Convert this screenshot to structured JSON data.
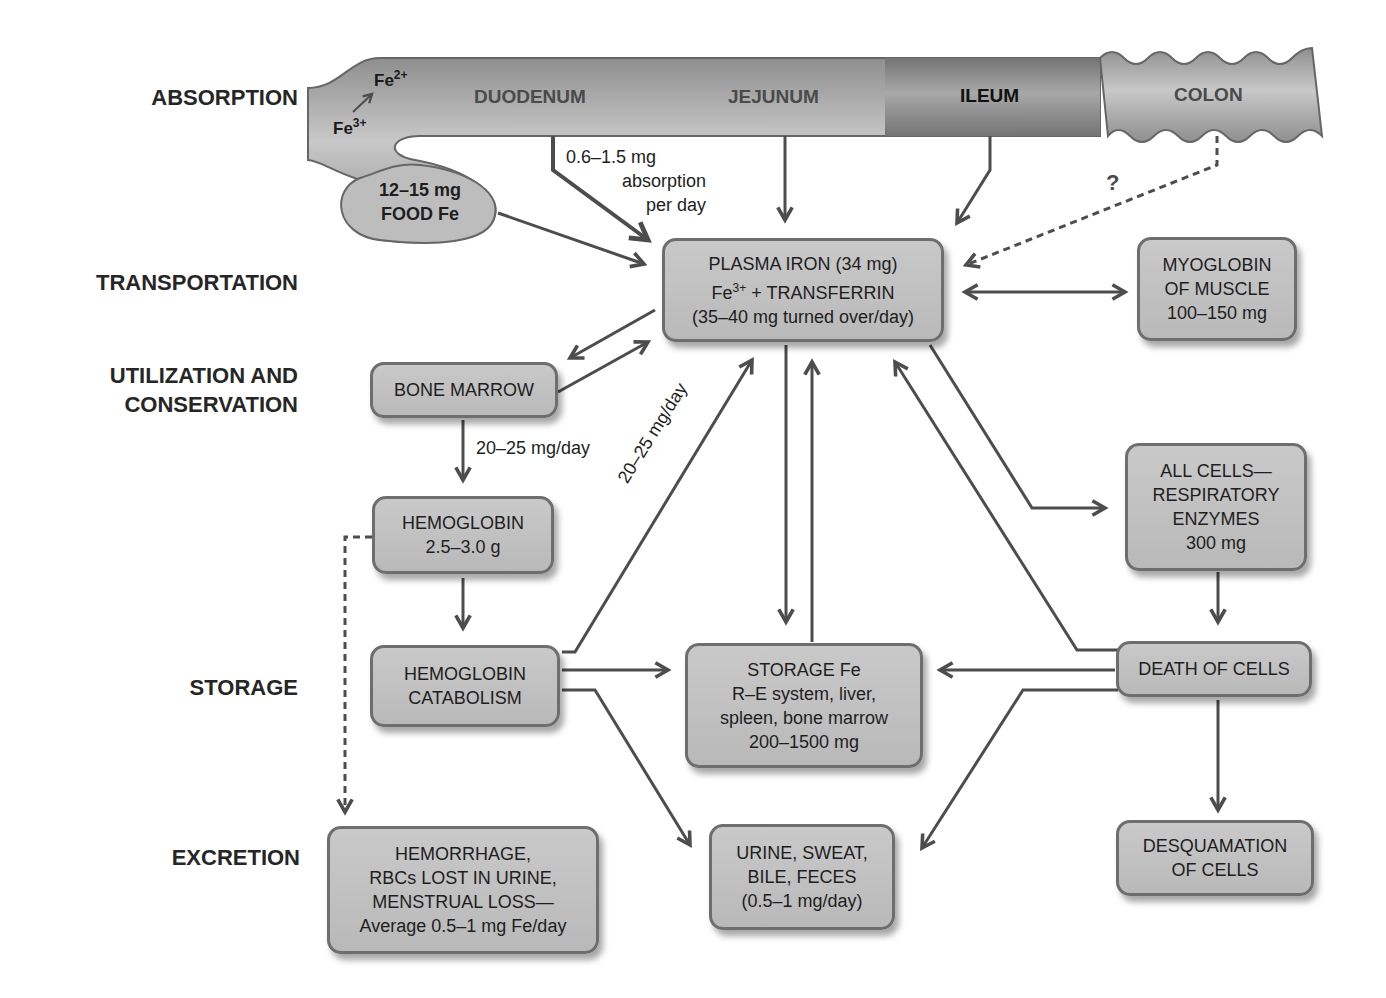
{
  "stages": {
    "absorption": "ABSORPTION",
    "transportation": "TRANSPORTATION",
    "utilization_1": "UTILIZATION AND",
    "utilization_2": "CONSERVATION",
    "storage": "STORAGE",
    "excretion": "EXCRETION"
  },
  "intestine": {
    "duodenum": "DUODENUM",
    "jejunum": "JEJUNUM",
    "ileum": "ILEUM",
    "colon": "COLON",
    "fe2": "Fe",
    "fe2_sup": "2+",
    "fe3": "Fe",
    "fe3_sup": "3+",
    "question": "?"
  },
  "food": {
    "line1": "12–15 mg",
    "line2": "FOOD Fe"
  },
  "notes": {
    "absorption_1": "0.6–1.5 mg",
    "absorption_2": "absorption",
    "absorption_3": "per day",
    "marrow_rate": "20–25 mg/day",
    "catabolism_rate": "20–25 mg/day"
  },
  "boxes": {
    "plasma": {
      "line1": "PLASMA IRON (34 mg)",
      "line2a": "Fe",
      "line2_sup": "3+",
      "line2b": " + TRANSFERRIN",
      "line3": "(35–40 mg turned over/day)"
    },
    "myoglobin": {
      "line1": "MYOGLOBIN",
      "line2": "OF MUSCLE",
      "line3": "100–150 mg"
    },
    "bone_marrow": {
      "line1": "BONE MARROW"
    },
    "hemoglobin": {
      "line1": "HEMOGLOBIN",
      "line2": "2.5–3.0 g"
    },
    "catabolism": {
      "line1": "HEMOGLOBIN",
      "line2": "CATABOLISM"
    },
    "all_cells": {
      "line1": "ALL CELLS—",
      "line2": "RESPIRATORY",
      "line3": "ENZYMES",
      "line4": "300 mg"
    },
    "storage": {
      "line1": "STORAGE Fe",
      "line2": "R–E system, liver,",
      "line3": "spleen, bone marrow",
      "line4": "200–1500 mg"
    },
    "death": {
      "line1": "DEATH OF CELLS"
    },
    "hemorrhage": {
      "line1": "HEMORRHAGE,",
      "line2": "RBCs LOST IN URINE,",
      "line3": "MENSTRUAL LOSS—",
      "line4": "Average 0.5–1 mg Fe/day"
    },
    "urine": {
      "line1": "URINE, SWEAT,",
      "line2": "BILE, FECES",
      "line3": "(0.5–1 mg/day)"
    },
    "desquamation": {
      "line1": "DESQUAMATION",
      "line2": "OF CELLS"
    }
  },
  "colors": {
    "box_fill": "#c2c2c2",
    "box_border": "#6e6e6e",
    "arrow": "#4d4d4d",
    "gut": "#b0b0b0"
  }
}
